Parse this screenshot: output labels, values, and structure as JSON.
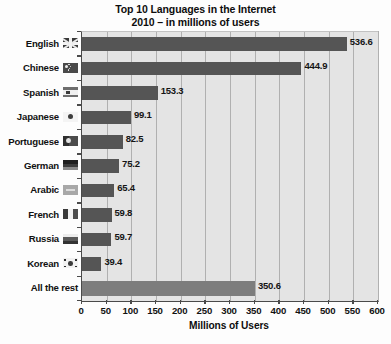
{
  "chart_data": {
    "type": "bar",
    "orientation": "horizontal",
    "title_line1": "Top 10 Languages in the Internet",
    "title_line2": "2010 – in millions of users",
    "xlabel": "Millions of Users",
    "ylabel": "",
    "xlim": [
      0,
      600
    ],
    "xticks": [
      0,
      50,
      100,
      150,
      200,
      250,
      300,
      350,
      400,
      450,
      500,
      550,
      600
    ],
    "xtick_labels": [
      "0",
      "50",
      "100",
      "150",
      "200",
      "250",
      "300",
      "350",
      "400",
      "450",
      "500",
      "550",
      "600"
    ],
    "grid": true,
    "grid_axis": "x",
    "legend": null,
    "categories": [
      "English",
      "Chinese",
      "Spanish",
      "Japanese",
      "Portuguese",
      "German",
      "Arabic",
      "French",
      "Russia",
      "Korean",
      "All the rest"
    ],
    "values": [
      536.6,
      444.9,
      153.3,
      99.1,
      82.5,
      75.2,
      65.4,
      59.8,
      59.7,
      39.4,
      350.6
    ],
    "value_labels": [
      "536.6",
      "444.9",
      "153.3",
      "99.1",
      "82.5",
      "75.2",
      "65.4",
      "59.8",
      "59.7",
      "39.4",
      "350.6"
    ],
    "bar_colors": [
      "#555555",
      "#555555",
      "#555555",
      "#555555",
      "#555555",
      "#555555",
      "#555555",
      "#555555",
      "#555555",
      "#555555",
      "#7d7d7d"
    ],
    "flags": [
      "uk",
      "cn",
      "es",
      "jp",
      "pt",
      "de",
      "ar",
      "fr",
      "ru",
      "kr",
      "none"
    ],
    "plot_background": "#e4e4e4",
    "axis_color": "#4a4a4a",
    "gridline_color": "#b0b0b0"
  }
}
